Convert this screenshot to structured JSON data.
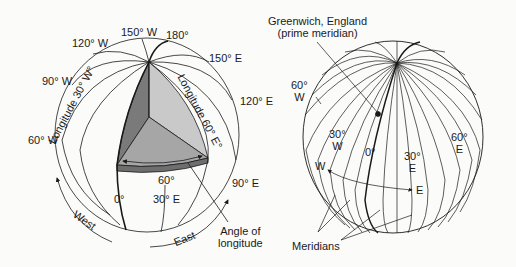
{
  "left_globe": {
    "meridian_labels": {
      "w150": "150° W",
      "e180": "180°",
      "w120": "120° W",
      "e150": "150° E",
      "w90": "90° W",
      "e120": "120° E",
      "w60": "60° W",
      "e90": "90° E",
      "zero": "0°",
      "e30": "30° E"
    },
    "longitude_30w": "Longitude 30° W°",
    "longitude_60e": "Longitude 60° E°",
    "angle_value": "60°",
    "west_label": "West",
    "east_label": "East",
    "angle_callout": [
      "Angle of",
      "longitude"
    ],
    "colors": {
      "dark_face": "#7a7a7a",
      "light_face": "#c6c6c6",
      "mid_face": "#a4a4a4",
      "line": "#1a1a1a"
    }
  },
  "right_globe": {
    "greenwich_callout": [
      "Greenwich, England",
      "(prime meridian)"
    ],
    "labels": {
      "w60": [
        "60°",
        "W"
      ],
      "w30": [
        "30°",
        "W"
      ],
      "zero": "0°",
      "e30": [
        "30°",
        "E"
      ],
      "e60": [
        "60°",
        "E"
      ],
      "w_dir": "W",
      "e_dir": "E"
    },
    "meridians_label": "Meridians"
  }
}
